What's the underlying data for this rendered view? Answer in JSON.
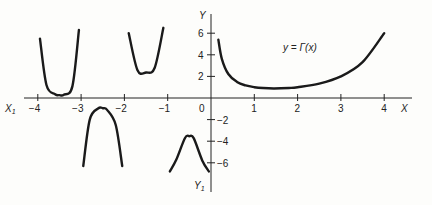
{
  "chart_data": {
    "type": "line",
    "title": "",
    "function_label": "y = Γ(x)",
    "xlabel": "X",
    "ylabel": "Y",
    "x_neg_axis_label": "X1",
    "y_neg_axis_label": "Y1",
    "x_ticks": [
      "-4",
      "-3",
      "-2",
      "-1",
      "0",
      "1",
      "2",
      "3",
      "4"
    ],
    "y_ticks": [
      "6",
      "4",
      "2",
      "-2",
      "-4",
      "-6"
    ],
    "xlim": [
      -4.3,
      4.6
    ],
    "ylim": [
      -7,
      7
    ],
    "grid": false,
    "series": [
      {
        "name": "Gamma (0,4]",
        "x": [
          0.17,
          0.25,
          0.4,
          0.6,
          0.8,
          1.0,
          1.2,
          1.46,
          1.8,
          2.0,
          2.5,
          3.0,
          3.5,
          4.0
        ],
        "y": [
          5.4,
          3.63,
          2.22,
          1.49,
          1.16,
          1.0,
          0.92,
          0.886,
          0.93,
          1.0,
          1.33,
          2.0,
          3.32,
          6.0
        ]
      },
      {
        "name": "Gamma (-1,0)",
        "x": [
          -0.95,
          -0.8,
          -0.6,
          -0.5,
          -0.4,
          -0.2,
          -0.05
        ],
        "y": [
          -6.8,
          -5.7,
          -3.7,
          -3.54,
          -3.72,
          -5.8,
          -6.8
        ]
      },
      {
        "name": "Gamma (-2,-1)",
        "x": [
          -1.9,
          -1.7,
          -1.5,
          -1.3,
          -1.1
        ],
        "y": [
          6.0,
          2.6,
          2.36,
          2.8,
          6.5
        ]
      },
      {
        "name": "Gamma (-3,-2)",
        "x": [
          -2.95,
          -2.8,
          -2.6,
          -2.5,
          -2.4,
          -2.2,
          -2.05
        ],
        "y": [
          -6.3,
          -2.0,
          -0.95,
          -0.95,
          -1.1,
          -2.5,
          -6.3
        ]
      },
      {
        "name": "Gamma (-4,-3)",
        "x": [
          -3.95,
          -3.8,
          -3.6,
          -3.5,
          -3.4,
          -3.2,
          -3.05
        ],
        "y": [
          5.5,
          1.2,
          0.35,
          0.27,
          0.3,
          1.1,
          6.3
        ]
      }
    ]
  },
  "labels": {
    "func": "y = Γ(x)",
    "X": "X",
    "Y": "Y",
    "X1": "X",
    "X1_sub": "1",
    "Y1": "Y",
    "Y1_sub": "1"
  }
}
